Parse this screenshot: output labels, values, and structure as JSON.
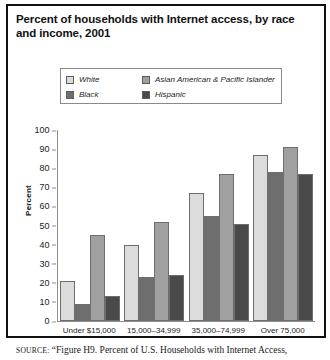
{
  "title": "Percent of households with Internet access, by race and income, 2001",
  "legend": {
    "items": [
      {
        "label": "White",
        "color": "#dcdcdc"
      },
      {
        "label": "Asian American & Pacific Islander",
        "color": "#a0a0a0"
      },
      {
        "label": "Black",
        "color": "#6e6e6e"
      },
      {
        "label": "Hispanic",
        "color": "#4a4a4a"
      }
    ]
  },
  "source": {
    "prefix": "SOURCE:",
    "text": "“Figure H9. Percent of U.S. Households with Internet Access,"
  },
  "chart_data": {
    "type": "bar",
    "title": "Percent of households with Internet access, by race and income, 2001",
    "xlabel": "",
    "ylabel": "Percent",
    "ylim": [
      0,
      100
    ],
    "yticks": [
      0,
      10,
      20,
      30,
      40,
      50,
      60,
      70,
      80,
      90,
      100
    ],
    "grid": false,
    "legend_position": "top",
    "categories": [
      "Under $15,000",
      "15,000–34,999",
      "35,000–74,999",
      "Over 75,000"
    ],
    "series": [
      {
        "name": "White",
        "color": "#dcdcdc",
        "values": [
          21,
          40,
          67,
          87
        ]
      },
      {
        "name": "Black",
        "color": "#6e6e6e",
        "values": [
          9,
          23,
          55,
          78
        ]
      },
      {
        "name": "Asian American & Pacific Islander",
        "color": "#a0a0a0",
        "values": [
          45,
          52,
          77,
          91
        ]
      },
      {
        "name": "Hispanic",
        "color": "#4a4a4a",
        "values": [
          13,
          24,
          51,
          77
        ]
      }
    ]
  }
}
